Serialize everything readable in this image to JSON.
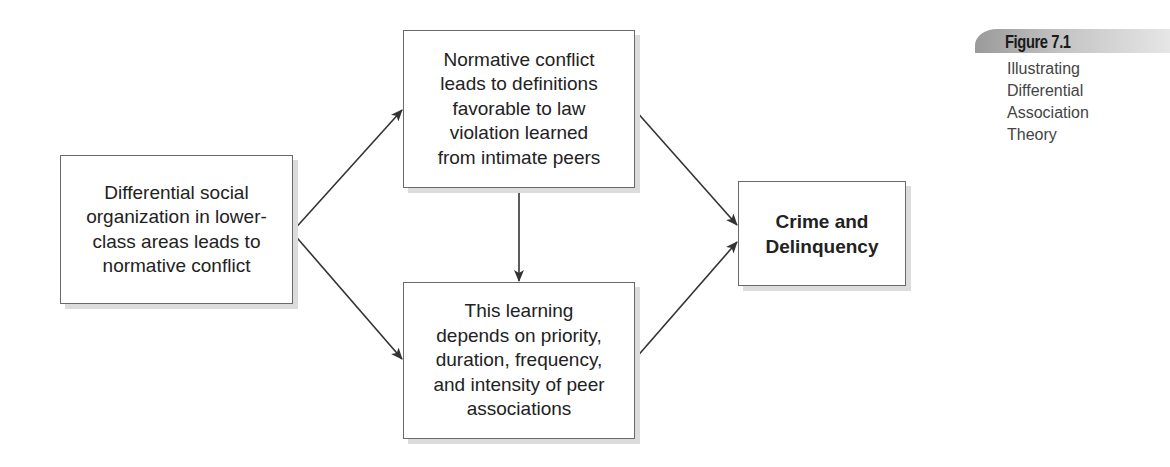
{
  "figure": {
    "label": "Figure 7.1",
    "caption_lines": [
      "Illustrating",
      "Differential",
      "Association",
      "Theory"
    ]
  },
  "diagram": {
    "nodes": {
      "social_organization": {
        "lines": [
          "Differential social",
          "organization in lower-",
          "class areas leads to",
          "normative conflict"
        ]
      },
      "normative_conflict": {
        "lines": [
          "Normative conflict",
          "leads to definitions",
          "favorable to law",
          "violation learned",
          "from intimate peers"
        ]
      },
      "learning": {
        "lines": [
          "This learning",
          "depends on priority,",
          "duration, frequency,",
          "and intensity of peer",
          "associations"
        ]
      },
      "outcome": {
        "lines": [
          "Crime and",
          "Delinquency"
        ]
      }
    },
    "edges": [
      {
        "from": "social_organization",
        "to": "normative_conflict"
      },
      {
        "from": "social_organization",
        "to": "learning"
      },
      {
        "from": "normative_conflict",
        "to": "learning"
      },
      {
        "from": "normative_conflict",
        "to": "outcome"
      },
      {
        "from": "learning",
        "to": "outcome"
      }
    ],
    "colors": {
      "line": "#333333",
      "box_border": "#6a6a6a",
      "shadow": "#dcdcdc"
    }
  }
}
